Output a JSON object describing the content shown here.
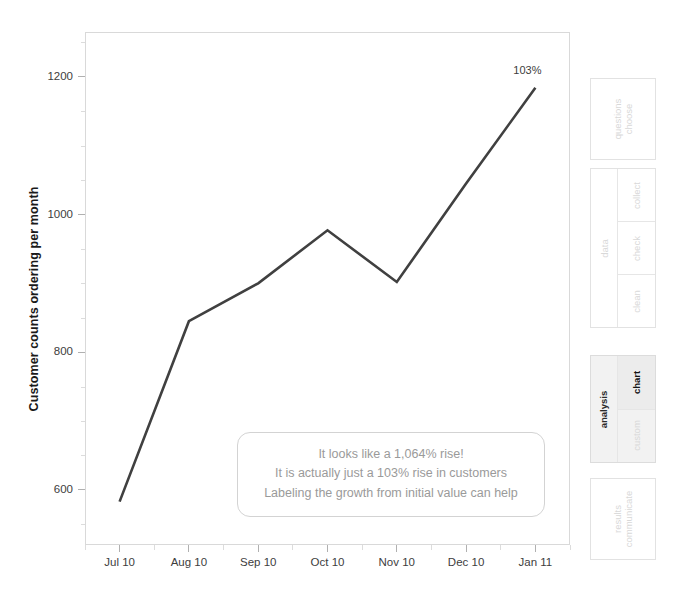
{
  "chart_data": {
    "type": "line",
    "title": "",
    "xlabel": "",
    "ylabel": "Customer counts ordering per month",
    "categories": [
      "Jul 10",
      "Aug 10",
      "Sep 10",
      "Oct 10",
      "Nov 10",
      "Dec 10",
      "Jan 11"
    ],
    "values": [
      583,
      845,
      900,
      977,
      902,
      1045,
      1184
    ],
    "series": [
      {
        "name": "Customer counts ordering per month",
        "values": [
          583,
          845,
          900,
          977,
          902,
          1045,
          1184
        ],
        "color": "#404040"
      }
    ],
    "ylim": [
      520,
      1265
    ],
    "yticks": [
      600,
      800,
      1000,
      1200
    ],
    "ytick_labels": [
      "600",
      "800",
      "1000",
      "1200"
    ],
    "grid": false,
    "legend": false,
    "legend_position": "none",
    "point_labels": [
      {
        "category": "Jan 11",
        "value": 1184,
        "text": "103%"
      }
    ],
    "annotations": [
      {
        "name": "callout",
        "lines": [
          "It looks like a 1,064% rise!",
          "It is actually just a 103% rise in customers",
          "Labeling the growth from initial value can help"
        ]
      }
    ]
  },
  "axes": {
    "y_title": "Customer counts ordering per month",
    "y_ticks": [
      "1200",
      "1000",
      "800",
      "600"
    ],
    "x_ticks": [
      "Jul 10",
      "Aug 10",
      "Sep 10",
      "Oct 10",
      "Nov 10",
      "Dec 10",
      "Jan 11"
    ]
  },
  "annotation": {
    "line1": "It looks like a 1,064% rise!",
    "line2": "It is actually just a 103% rise in customers",
    "line3": "Labeling the growth from initial value can help"
  },
  "end_label": {
    "text": "103%"
  },
  "workflow": {
    "groups": [
      {
        "id": "choose-questions",
        "label": "choose",
        "second_word": "questions",
        "active": false,
        "items": []
      },
      {
        "id": "data",
        "label": "data",
        "active": false,
        "items": [
          {
            "label": "collect",
            "selected": false
          },
          {
            "label": "check",
            "selected": false
          },
          {
            "label": "clean",
            "selected": false
          }
        ]
      },
      {
        "id": "analysis",
        "label": "analysis",
        "active": true,
        "items": [
          {
            "label": "chart",
            "selected": true
          },
          {
            "label": "custom",
            "selected": false
          }
        ]
      },
      {
        "id": "communicate-results",
        "label": "communicate",
        "second_word": "results",
        "active": false,
        "items": []
      }
    ]
  },
  "colors": {
    "line": "#404040",
    "axis": "#d9d9d9",
    "tick_text": "#3d3d3d",
    "annotation_text": "#9a9a9a",
    "sidebar_inactive": "#d8d8d8",
    "sidebar_active": "#141414",
    "sidebar_active_bg": "#ececec"
  }
}
